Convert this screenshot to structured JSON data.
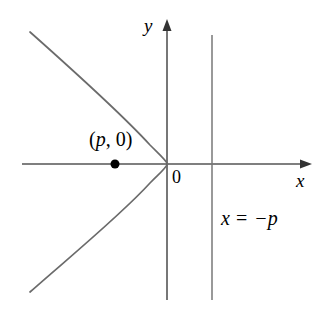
{
  "figure": {
    "type": "math-diagram",
    "background_color": "#ffffff",
    "stroke_color": "#555555",
    "axis_color": "#555555",
    "text_color": "#000000"
  },
  "axes": {
    "y_axis_label": "y",
    "x_axis_label": "x",
    "origin_label": "0",
    "x_axis_y_px": 164,
    "y_axis_x_px": 167,
    "x_axis_start_px": 22,
    "x_axis_end_px": 312,
    "y_axis_top_px": 20,
    "y_axis_bottom_px": 300
  },
  "focus": {
    "label": "(p, 0)",
    "label_open_paren": "(",
    "label_variable": "p",
    "label_comma": ", ",
    "label_zero": "0",
    "label_close_paren": ")",
    "x_px": 115,
    "y_px": 164,
    "radius_px": 4.5
  },
  "directrix": {
    "label": "x = −p",
    "label_variable": "x",
    "label_equals": "=",
    "label_value": "−p",
    "line_x_px": 212,
    "line_top_px": 35,
    "line_bottom_px": 300
  },
  "curve": {
    "name": "parabola",
    "opens": "left",
    "vertex_x_px": 167,
    "vertex_y_px": 164,
    "equation": "y^2 = -4px",
    "path": "M 30 32 C 66 64, 120 112, 150 145 C 160 155, 166 160, 167.5 164 C 166 168, 160 173, 150 183 C 120 216, 66 260, 30 292"
  },
  "chart_data": {
    "type": "line",
    "title": "",
    "xlabel": "x",
    "ylabel": "y",
    "annotations": [
      {
        "text": "(p, 0)",
        "kind": "focus-point",
        "x": -0.42,
        "y": 0
      },
      {
        "text": "x = −p",
        "kind": "directrix-line",
        "x": 0.42,
        "y": -0.45
      },
      {
        "text": "0",
        "kind": "origin",
        "x": 0.04,
        "y": -0.07
      }
    ],
    "series": [
      {
        "name": "parabola y^2 = -4px",
        "points_px": [
          [
            30,
            32
          ],
          [
            48,
            48
          ],
          [
            66,
            64
          ],
          [
            84,
            81
          ],
          [
            102,
            98
          ],
          [
            120,
            112
          ],
          [
            136,
            130
          ],
          [
            150,
            145
          ],
          [
            160,
            155
          ],
          [
            167.5,
            164
          ],
          [
            160,
            173
          ],
          [
            150,
            183
          ],
          [
            136,
            198
          ],
          [
            120,
            216
          ],
          [
            102,
            230
          ],
          [
            84,
            247
          ],
          [
            66,
            260
          ],
          [
            48,
            276
          ],
          [
            30,
            292
          ]
        ]
      },
      {
        "name": "directrix x = -p",
        "points_px": [
          [
            212,
            35
          ],
          [
            212,
            300
          ]
        ]
      }
    ],
    "grid": false,
    "legend": "none"
  }
}
